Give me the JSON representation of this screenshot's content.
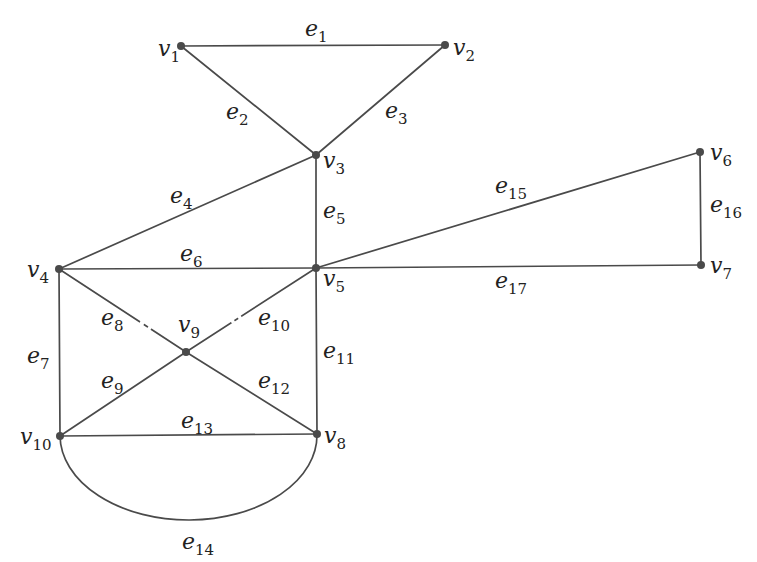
{
  "diagram": {
    "type": "undirected-graph",
    "colors": {
      "stroke": "#4a4a4a",
      "text": "#222222",
      "background": "#ffffff"
    },
    "vertices": [
      {
        "id": "v1",
        "base": "v",
        "sub": "1",
        "x": 181,
        "y": 46,
        "lx": 158,
        "ly": 56,
        "anchor": "start"
      },
      {
        "id": "v2",
        "base": "v",
        "sub": "2",
        "x": 445,
        "y": 45,
        "lx": 453,
        "ly": 55,
        "anchor": "start"
      },
      {
        "id": "v3",
        "base": "v",
        "sub": "3",
        "x": 316,
        "y": 155,
        "lx": 323,
        "ly": 168,
        "anchor": "start"
      },
      {
        "id": "v4",
        "base": "v",
        "sub": "4",
        "x": 59,
        "y": 269,
        "lx": 27,
        "ly": 277,
        "anchor": "start"
      },
      {
        "id": "v5",
        "base": "v",
        "sub": "5",
        "x": 316,
        "y": 268,
        "lx": 323,
        "ly": 286,
        "anchor": "start"
      },
      {
        "id": "v6",
        "base": "v",
        "sub": "6",
        "x": 700,
        "y": 152,
        "lx": 710,
        "ly": 160,
        "anchor": "start"
      },
      {
        "id": "v7",
        "base": "v",
        "sub": "7",
        "x": 701,
        "y": 265,
        "lx": 710,
        "ly": 273,
        "anchor": "start"
      },
      {
        "id": "v8",
        "base": "v",
        "sub": "8",
        "x": 317,
        "y": 434,
        "lx": 324,
        "ly": 443,
        "anchor": "start"
      },
      {
        "id": "v9",
        "base": "v",
        "sub": "9",
        "x": 186,
        "y": 352,
        "lx": 178,
        "ly": 332,
        "anchor": "start"
      },
      {
        "id": "v10",
        "base": "v",
        "sub": "10",
        "x": 60,
        "y": 436,
        "lx": 20,
        "ly": 444,
        "anchor": "start"
      }
    ],
    "edges": [
      {
        "id": "e1",
        "from": "v1",
        "to": "v2",
        "base": "e",
        "sub": "1",
        "lx": 305,
        "ly": 36
      },
      {
        "id": "e2",
        "from": "v1",
        "to": "v3",
        "base": "e",
        "sub": "2",
        "lx": 226,
        "ly": 119
      },
      {
        "id": "e3",
        "from": "v2",
        "to": "v3",
        "base": "e",
        "sub": "3",
        "lx": 385,
        "ly": 118
      },
      {
        "id": "e4",
        "from": "v3",
        "to": "v4",
        "base": "e",
        "sub": "4",
        "lx": 170,
        "ly": 203
      },
      {
        "id": "e5",
        "from": "v3",
        "to": "v5",
        "base": "e",
        "sub": "5",
        "lx": 323,
        "ly": 218
      },
      {
        "id": "e6",
        "from": "v4",
        "to": "v5",
        "base": "e",
        "sub": "6",
        "lx": 180,
        "ly": 261
      },
      {
        "id": "e7",
        "from": "v4",
        "to": "v10",
        "base": "e",
        "sub": "7",
        "lx": 27,
        "ly": 363
      },
      {
        "id": "e8",
        "from": "v4",
        "to": "v9",
        "base": "e",
        "sub": "8",
        "lx": 101,
        "ly": 325
      },
      {
        "id": "e9",
        "from": "v9",
        "to": "v10",
        "base": "e",
        "sub": "9",
        "lx": 101,
        "ly": 388
      },
      {
        "id": "e10",
        "from": "v9",
        "to": "v5",
        "base": "e",
        "sub": "10",
        "lx": 258,
        "ly": 325
      },
      {
        "id": "e11",
        "from": "v5",
        "to": "v8",
        "base": "e",
        "sub": "11",
        "lx": 323,
        "ly": 358
      },
      {
        "id": "e12",
        "from": "v9",
        "to": "v8",
        "base": "e",
        "sub": "12",
        "lx": 258,
        "ly": 388
      },
      {
        "id": "e13",
        "from": "v10",
        "to": "v8",
        "base": "e",
        "sub": "13",
        "lx": 181,
        "ly": 428
      },
      {
        "id": "e14",
        "from": "v10",
        "to": "v8",
        "base": "e",
        "sub": "14",
        "lx": 182,
        "ly": 549,
        "curved": true
      },
      {
        "id": "e15",
        "from": "v5",
        "to": "v6",
        "base": "e",
        "sub": "15",
        "lx": 495,
        "ly": 193
      },
      {
        "id": "e16",
        "from": "v6",
        "to": "v7",
        "base": "e",
        "sub": "16",
        "lx": 710,
        "ly": 212
      },
      {
        "id": "e17",
        "from": "v5",
        "to": "v7",
        "base": "e",
        "sub": "17",
        "lx": 495,
        "ly": 288
      }
    ]
  }
}
